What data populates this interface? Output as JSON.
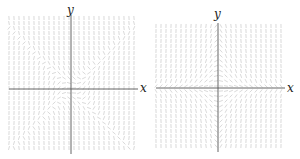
{
  "figure": {
    "panels": [
      {
        "id": "left",
        "x_label": "x",
        "y_label": "y",
        "field": "x*x - y*y",
        "origin": [
          71,
          89
        ],
        "extent": {
          "left": 9,
          "right": 135,
          "top": 18,
          "bottom": 152
        },
        "grid_step": 5,
        "segment_length": 4,
        "scale": 0.04
      },
      {
        "id": "right",
        "x_label": "x",
        "y_label": "y",
        "field": "-x*y",
        "origin": [
          68,
          88
        ],
        "extent": {
          "left": 6,
          "right": 132,
          "top": 26,
          "bottom": 150
        },
        "grid_step": 5,
        "segment_length": 4,
        "scale": 0.04
      }
    ],
    "colors": {
      "axis": "#555555",
      "field": "#c8c8c8"
    }
  }
}
